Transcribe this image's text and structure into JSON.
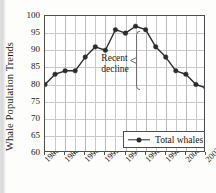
{
  "chart_data": {
    "type": "line",
    "title": "",
    "xlabel": "",
    "ylabel": "Whale Population Trends",
    "ylim": [
      60,
      100
    ],
    "ytick_step": 5,
    "yticks": [
      100,
      95,
      90,
      85,
      80,
      75,
      70,
      65,
      60
    ],
    "xlim": [
      1986,
      2002
    ],
    "xticks": [
      1986,
      1988,
      1990,
      1992,
      1994,
      1996,
      1998,
      2000,
      2002
    ],
    "x": [
      1986,
      1987,
      1988,
      1989,
      1990,
      1991,
      1992,
      1993,
      1994,
      1995,
      1996,
      1997,
      1998,
      1999,
      2000,
      2001,
      2002
    ],
    "series": [
      {
        "name": "Total whales",
        "values": [
          80,
          83,
          84,
          84,
          88,
          91,
          90,
          96,
          95,
          97,
          96,
          91,
          88,
          84,
          83,
          80,
          79
        ]
      }
    ],
    "grid": true,
    "legend_position": "bottom-right",
    "legend_entries": [
      "Total whales"
    ],
    "annotations": [
      {
        "text_line1": "Recent",
        "text_line2": "decline",
        "marker": "vertical-bracket",
        "points_to_x": 1995
      }
    ],
    "marker_color": "#2b2b2b",
    "line_color": "#2b2b2b",
    "grid_color": "#c9c9c9",
    "frame_color": "#4d4d4d"
  },
  "legend": {
    "label": "Total whales"
  },
  "annotation": {
    "line1": "Recent",
    "line2": "decline"
  },
  "axis": {
    "y_title": "Whale Population Trends"
  }
}
